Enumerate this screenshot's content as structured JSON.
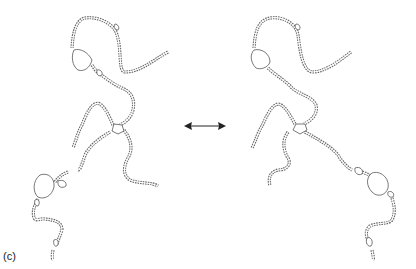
{
  "figure": {
    "panel_label": "(c)",
    "left_structure": {
      "name": "structure-left"
    },
    "right_structure": {
      "name": "structure-right"
    },
    "arrow": {
      "type": "double-headed",
      "color": "#222222"
    }
  }
}
